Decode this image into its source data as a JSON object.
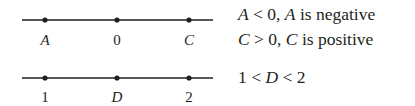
{
  "number_lines": [
    {
      "y": 20,
      "x_start": 22,
      "x_end": 213,
      "points": [
        {
          "x": 45,
          "label": "A",
          "italic": true
        },
        {
          "x": 117,
          "label": "0",
          "italic": false
        },
        {
          "x": 189,
          "label": "C",
          "italic": true
        }
      ]
    },
    {
      "y": 78,
      "x_start": 22,
      "x_end": 213,
      "points": [
        {
          "x": 45,
          "label": "1",
          "italic": false
        },
        {
          "x": 117,
          "label": "D",
          "italic": true
        },
        {
          "x": 189,
          "label": "2",
          "italic": false
        }
      ]
    }
  ],
  "statements": {
    "line1": {
      "var1": "A",
      "rel": " < 0, ",
      "var2": "A",
      "rest": " is negative"
    },
    "line2": {
      "var1": "C",
      "rel": " > 0, ",
      "var2": "C",
      "rest": " is positive"
    },
    "line3": {
      "pre": "1 < ",
      "var": "D",
      "post": " < 2"
    }
  },
  "colors": {
    "ink": "#231f20"
  }
}
